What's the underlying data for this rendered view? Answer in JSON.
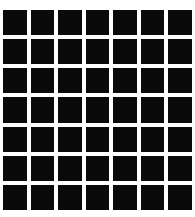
{
  "figure": {
    "name": "scintillating-grid-pattern",
    "rows": 7,
    "cols": 7,
    "square_count": 49,
    "square_color": "#0a0a0a",
    "background_color": "#ffffff",
    "gap_px": 4
  }
}
